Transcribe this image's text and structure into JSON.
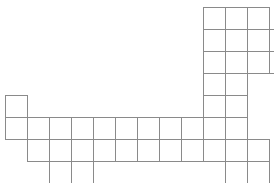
{
  "figure": {
    "background_color": "#ffffff",
    "stroke_color": "#8a8a8a",
    "stroke_width": 1,
    "cell_size": 22,
    "origin_x": 5,
    "origin_y": 7,
    "canvas": {
      "width": 274,
      "height": 183
    },
    "columns": 12,
    "rows": 8,
    "cell_count": 58,
    "cells": [
      {
        "col": 9,
        "row": 0
      },
      {
        "col": 10,
        "row": 0
      },
      {
        "col": 11,
        "row": 0
      },
      {
        "col": 9,
        "row": 1
      },
      {
        "col": 10,
        "row": 1
      },
      {
        "col": 11,
        "row": 1
      },
      {
        "col": 12,
        "row": 1
      },
      {
        "col": 9,
        "row": 2
      },
      {
        "col": 10,
        "row": 2
      },
      {
        "col": 11,
        "row": 2
      },
      {
        "col": 12,
        "row": 2
      },
      {
        "col": 9,
        "row": 3
      },
      {
        "col": 10,
        "row": 3
      },
      {
        "col": 9,
        "row": 4
      },
      {
        "col": 10,
        "row": 4
      },
      {
        "col": 0,
        "row": 4
      },
      {
        "col": 0,
        "row": 5
      },
      {
        "col": 1,
        "row": 5
      },
      {
        "col": 2,
        "row": 5
      },
      {
        "col": 3,
        "row": 5
      },
      {
        "col": 4,
        "row": 5
      },
      {
        "col": 5,
        "row": 5
      },
      {
        "col": 6,
        "row": 5
      },
      {
        "col": 7,
        "row": 5
      },
      {
        "col": 8,
        "row": 5
      },
      {
        "col": 9,
        "row": 5
      },
      {
        "col": 10,
        "row": 5
      },
      {
        "col": 1,
        "row": 6
      },
      {
        "col": 2,
        "row": 6
      },
      {
        "col": 3,
        "row": 6
      },
      {
        "col": 4,
        "row": 6
      },
      {
        "col": 5,
        "row": 6
      },
      {
        "col": 6,
        "row": 6
      },
      {
        "col": 7,
        "row": 6
      },
      {
        "col": 8,
        "row": 6
      },
      {
        "col": 9,
        "row": 6
      },
      {
        "col": 10,
        "row": 6
      },
      {
        "col": 11,
        "row": 6
      },
      {
        "col": 2,
        "row": 7
      },
      {
        "col": 3,
        "row": 7
      },
      {
        "col": 10,
        "row": 7
      },
      {
        "col": 11,
        "row": 7
      }
    ]
  }
}
